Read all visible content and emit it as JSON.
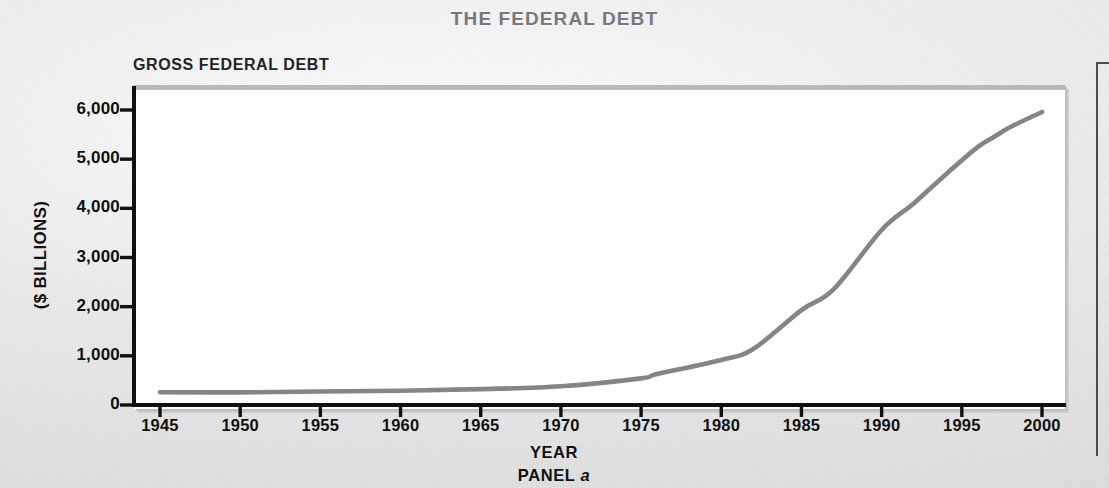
{
  "figure": {
    "title": "THE FEDERAL DEBT",
    "panel_heading": "GROSS FEDERAL DEBT",
    "panel_caption_prefix": "PANEL ",
    "panel_caption_letter": "a",
    "title_color": "#777879",
    "line_color": "#858585",
    "axis_color": "#111111"
  },
  "chart_data": {
    "type": "line",
    "title": "GROSS FEDERAL DEBT",
    "xlabel": "YEAR",
    "ylabel": "($ BILLIONS)",
    "xlim": [
      1945,
      2000
    ],
    "ylim": [
      0,
      6000
    ],
    "grid": false,
    "legend": null,
    "xticks": [
      1945,
      1950,
      1955,
      1960,
      1965,
      1970,
      1975,
      1980,
      1985,
      1990,
      1995,
      2000
    ],
    "xtick_labels": [
      "1945",
      "1950",
      "1955",
      "1960",
      "1965",
      "1970",
      "1975",
      "1980",
      "1985",
      "1990",
      "1995",
      "2000"
    ],
    "yticks": [
      0,
      1000,
      2000,
      3000,
      4000,
      5000,
      6000
    ],
    "ytick_labels": [
      "0",
      "1,000",
      "2,000",
      "3,000",
      "4,000",
      "5,000",
      "6,000"
    ],
    "series": [
      {
        "name": "Gross Federal Debt",
        "x": [
          1945,
          1950,
          1955,
          1960,
          1965,
          1970,
          1975,
          1976,
          1980,
          1982,
          1985,
          1987,
          1990,
          1992,
          1994,
          1996,
          1997,
          1998,
          2000
        ],
        "values": [
          260,
          257,
          274,
          291,
          323,
          381,
          542,
          630,
          915,
          1140,
          1930,
          2350,
          3560,
          4100,
          4690,
          5250,
          5450,
          5650,
          5960
        ]
      }
    ]
  }
}
